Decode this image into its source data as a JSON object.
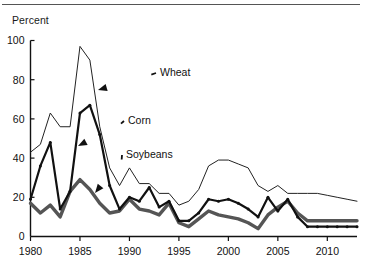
{
  "figure": {
    "ylabel": "Percent",
    "has_top_rule": true
  },
  "chart_data": {
    "type": "line",
    "title": "",
    "subtitle": "",
    "xlabel": "",
    "ylabel": "Percent",
    "xlim": [
      1980,
      2013
    ],
    "ylim": [
      0,
      100
    ],
    "yticks": [
      0,
      20,
      40,
      60,
      80,
      100
    ],
    "ytick_labels": [
      "0",
      "20",
      "40",
      "60",
      "80",
      "100"
    ],
    "xticks": [
      1980,
      1985,
      1990,
      1995,
      2000,
      2005,
      2010
    ],
    "xtick_labels": [
      "1980",
      "1985",
      "1990",
      "1995",
      "2000",
      "2005",
      "2010"
    ],
    "grid": false,
    "legend": "annotations",
    "annotations": [
      {
        "label": "Wheat",
        "text_x": 160,
        "text_y": 72,
        "target_x": 98,
        "target_y": 90
      },
      {
        "label": "Corn",
        "text_x": 128,
        "text_y": 120,
        "target_x": 78,
        "target_y": 146
      },
      {
        "label": "Soybeans",
        "text_x": 126,
        "text_y": 154,
        "target_x": 95,
        "target_y": 193
      }
    ],
    "x": [
      1980,
      1981,
      1982,
      1983,
      1984,
      1985,
      1986,
      1987,
      1988,
      1989,
      1990,
      1991,
      1992,
      1993,
      1994,
      1995,
      1996,
      1997,
      1998,
      1999,
      2000,
      2001,
      2002,
      2003,
      2004,
      2005,
      2006,
      2007,
      2008,
      2009,
      2010,
      2011,
      2012,
      2013
    ],
    "series": [
      {
        "name": "Wheat",
        "style": "thin-line",
        "color": "#222222",
        "linewidth": 1,
        "markers": false,
        "values": [
          43,
          47,
          63,
          56,
          56,
          97,
          90,
          56,
          35,
          26,
          35,
          27,
          27,
          22,
          22,
          16,
          18,
          24,
          36,
          39,
          39,
          37,
          35,
          26,
          23,
          26,
          22,
          22,
          22,
          22,
          21,
          20,
          19,
          18
        ]
      },
      {
        "name": "Corn",
        "style": "medium-line-with-markers",
        "color": "#111111",
        "linewidth": 2.2,
        "markers": true,
        "values": [
          19,
          36,
          48,
          14,
          23,
          63,
          67,
          52,
          26,
          14,
          20,
          18,
          25,
          15,
          18,
          8,
          8,
          12,
          19,
          18,
          19,
          17,
          14,
          10,
          20,
          13,
          19,
          10,
          5,
          5,
          5,
          5,
          5,
          5
        ]
      },
      {
        "name": "Soybeans",
        "style": "thick-line",
        "color": "#555555",
        "linewidth": 3.4,
        "markers": false,
        "values": [
          17,
          12,
          16,
          10,
          23,
          29,
          24,
          17,
          12,
          13,
          19,
          14,
          13,
          11,
          17,
          7,
          5,
          9,
          13,
          11,
          10,
          9,
          7,
          4,
          11,
          15,
          18,
          12,
          8,
          8,
          8,
          8,
          8,
          8
        ]
      }
    ]
  }
}
